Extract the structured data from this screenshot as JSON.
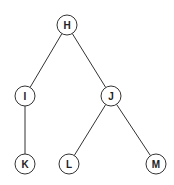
{
  "diagram": {
    "type": "tree",
    "node_radius": 10,
    "nodes": [
      {
        "id": "H",
        "label": "H",
        "x": 67,
        "y": 25
      },
      {
        "id": "I",
        "label": "I",
        "x": 25,
        "y": 96
      },
      {
        "id": "J",
        "label": "J",
        "x": 111,
        "y": 96
      },
      {
        "id": "K",
        "label": "K",
        "x": 25,
        "y": 164
      },
      {
        "id": "L",
        "label": "L",
        "x": 69,
        "y": 164
      },
      {
        "id": "M",
        "label": "M",
        "x": 156,
        "y": 164
      }
    ],
    "edges": [
      {
        "from": "H",
        "to": "I"
      },
      {
        "from": "H",
        "to": "J"
      },
      {
        "from": "I",
        "to": "K"
      },
      {
        "from": "J",
        "to": "L"
      },
      {
        "from": "J",
        "to": "M"
      }
    ]
  }
}
